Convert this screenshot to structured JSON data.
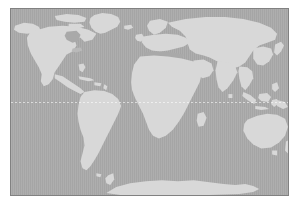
{
  "map": {
    "name": "world-map",
    "title": "World Map",
    "projection": "equirectangular",
    "colors": {
      "ocean": "#a9a9a9",
      "land": "#d8d8d8",
      "frame_border": "#818181",
      "page_background": "#ffffff",
      "graticule": "#ffffff"
    },
    "frame": {
      "left": 10,
      "top": 8,
      "width": 279,
      "height": 188,
      "border_width": 1
    },
    "graticule": {
      "equator_visible": true,
      "equator_style": "dotted",
      "equator_y_fraction": 0.5,
      "meridians_visible": false,
      "parallels_visible": false
    },
    "labels": [],
    "legend": [],
    "continents": [
      "North America",
      "South America",
      "Europe",
      "Africa",
      "Asia",
      "Australia",
      "Antarctica"
    ],
    "notable_features": [
      "Greenland",
      "Alaska",
      "Hudson Bay",
      "Gulf of Mexico",
      "Caribbean islands",
      "Mediterranean Sea",
      "Arabian Peninsula",
      "Indian subcontinent",
      "Japan",
      "Indonesia",
      "New Guinea",
      "New Zealand",
      "Madagascar",
      "British Isles",
      "Scandinavia"
    ]
  }
}
